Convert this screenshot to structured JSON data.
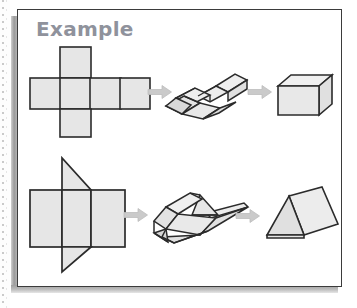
{
  "page": {
    "background_color": "#ffffff",
    "scan_artifact": "dotted-page-edge"
  },
  "example_box": {
    "border_color": "#3b3b3b",
    "fill_color": "#ffffff",
    "shadow_color": "#9a9a9a",
    "title": "Example"
  },
  "style": {
    "face_fill": "#e3e3e3",
    "face_fill_light": "#eeeeee",
    "face_fill_lighter": "#f2f2f2",
    "outline_color": "#2b2b2b",
    "outline_soft": "#555555",
    "arrow_color": "#c9c9c9",
    "arrow_outline": "#b2b2b2"
  },
  "rows": [
    {
      "id": "cube-row",
      "label": "cube folding sequence",
      "steps": [
        {
          "id": "cube-net",
          "label": "flat cross-shaped cube net"
        },
        {
          "id": "cube-folding",
          "label": "partially folded cube net"
        },
        {
          "id": "cube-solid",
          "label": "finished cube"
        }
      ],
      "arrows": [
        {
          "id": "cube-arrow-1",
          "label": "arrow-right-icon"
        },
        {
          "id": "cube-arrow-2",
          "label": "arrow-right-icon"
        }
      ]
    },
    {
      "id": "prism-row",
      "label": "triangular prism folding sequence",
      "steps": [
        {
          "id": "prism-net",
          "label": "flat triangular prism net"
        },
        {
          "id": "prism-folding",
          "label": "partially folded prism net"
        },
        {
          "id": "prism-solid",
          "label": "finished triangular prism"
        }
      ],
      "arrows": [
        {
          "id": "prism-arrow-1",
          "label": "arrow-right-icon"
        },
        {
          "id": "prism-arrow-2",
          "label": "arrow-right-icon"
        }
      ]
    }
  ]
}
